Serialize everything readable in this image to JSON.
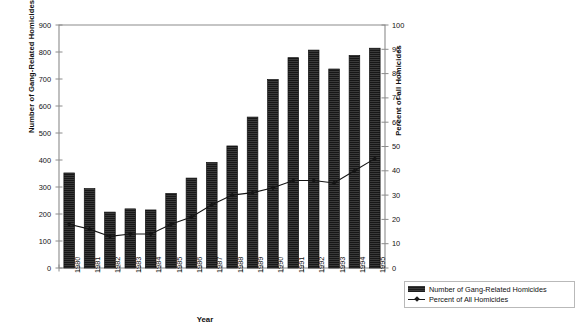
{
  "chart_data": {
    "type": "bar",
    "title": "",
    "xlabel": "Year",
    "ylabel": "Number of Gang-Related Homicides",
    "ylabel_secondary": "Percent of all Homicides",
    "categories": [
      "1980",
      "1981",
      "1982",
      "1983",
      "1984",
      "1985",
      "1986",
      "1987",
      "1988",
      "1989",
      "1990",
      "1991",
      "1992",
      "1993",
      "1994",
      "1995"
    ],
    "ylim": [
      0,
      900
    ],
    "ylim_secondary": [
      0,
      100
    ],
    "yticks": [
      0,
      100,
      200,
      300,
      400,
      500,
      600,
      700,
      800,
      900
    ],
    "yticks_secondary": [
      0,
      10,
      20,
      30,
      40,
      50,
      60,
      70,
      80,
      90,
      100
    ],
    "grid": false,
    "legend_position": "outside-bottom-right",
    "series": [
      {
        "name": "Number of Gang-Related Homicides",
        "type": "bar",
        "axis": "left",
        "color": "#2b2b2b",
        "values": [
          352,
          294,
          207,
          219,
          215,
          276,
          333,
          391,
          452,
          559,
          698,
          779,
          807,
          737,
          787,
          814
        ]
      },
      {
        "name": "Percent of All Homicides",
        "type": "line",
        "axis": "right",
        "color": "#1a1a1a",
        "marker": "diamond",
        "values": [
          18,
          16,
          13,
          14,
          14,
          18,
          21,
          26,
          30,
          31,
          33,
          36,
          36,
          35,
          40,
          45
        ]
      }
    ]
  },
  "axes": {
    "left": {
      "title": "Number of Gang-Related Homicides",
      "ticks": [
        "900",
        "800",
        "700",
        "600",
        "500",
        "400",
        "300",
        "200",
        "100",
        "0"
      ]
    },
    "right": {
      "title": "Percent of all Homicides",
      "ticks": [
        "100",
        "90",
        "80",
        "70",
        "60",
        "50",
        "40",
        "30",
        "20",
        "10",
        "0"
      ]
    },
    "bottom": {
      "title": "Year",
      "ticks": [
        "1980",
        "1981",
        "1982",
        "1983",
        "1984",
        "1985",
        "1986",
        "1987",
        "1988",
        "1989",
        "1990",
        "1991",
        "1992",
        "1993",
        "1994",
        "1995"
      ]
    }
  },
  "legend": {
    "items": [
      {
        "label": "Number of Gang-Related Homicides",
        "marker": "bar-swatch"
      },
      {
        "label": "Percent of All Homicides",
        "marker": "line-diamond-swatch"
      }
    ]
  }
}
